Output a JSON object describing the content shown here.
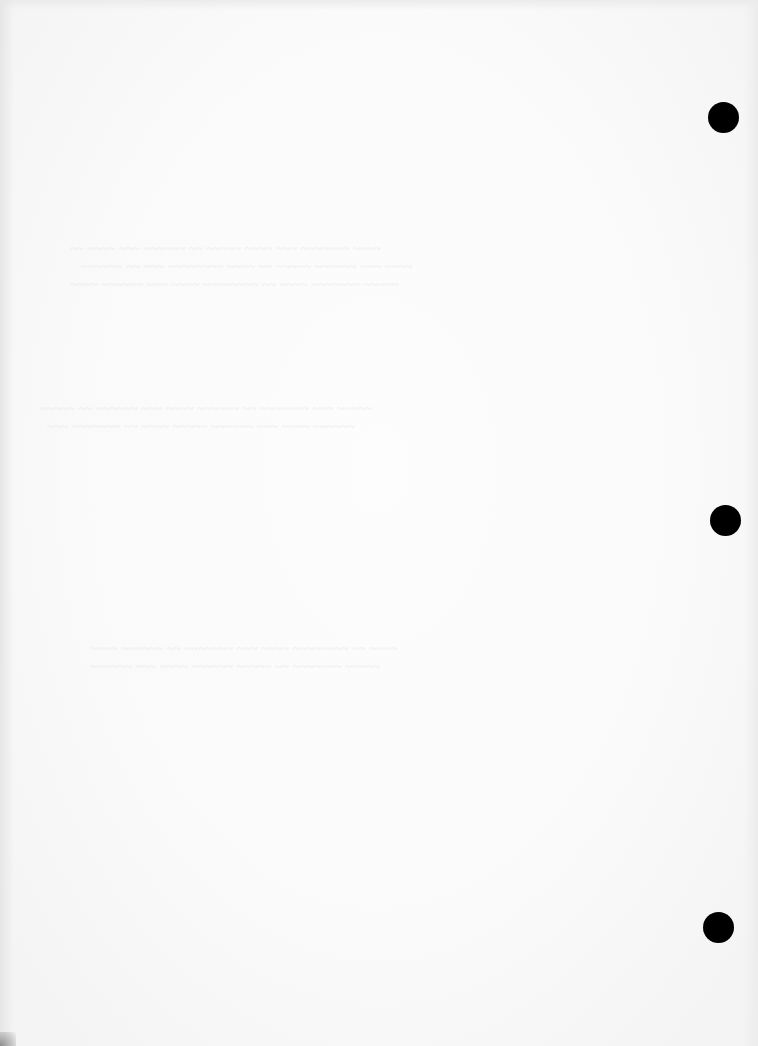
{
  "document": {
    "type": "scanned blank page",
    "background_color": "#fafafa",
    "visible_text": "",
    "bleed_through": {
      "description": "faint illegible mirrored text from reverse side",
      "color": "#e9e9e9"
    }
  },
  "punch_holes": [
    {
      "name": "top",
      "cx": 723,
      "cy": 117,
      "r": 15,
      "color": "#000000"
    },
    {
      "name": "middle",
      "cx": 725,
      "cy": 520,
      "r": 15,
      "color": "#000000"
    },
    {
      "name": "bottom",
      "cx": 718,
      "cy": 927,
      "r": 15,
      "color": "#000000"
    }
  ]
}
